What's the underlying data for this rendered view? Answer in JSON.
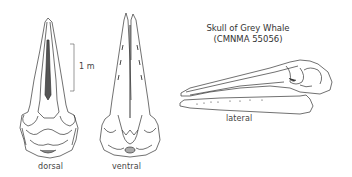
{
  "title": {
    "line1": "Skull of Grey Whale",
    "line2": "(CMNMA 55056)"
  },
  "scale_bar": {
    "label": "1 m"
  },
  "views": [
    {
      "id": "dorsal",
      "label": "dorsal"
    },
    {
      "id": "ventral",
      "label": "ventral"
    },
    {
      "id": "lateral",
      "label": "lateral"
    }
  ],
  "colors": {
    "line": "#333333",
    "shade": "#777777",
    "background": "#ffffff"
  }
}
